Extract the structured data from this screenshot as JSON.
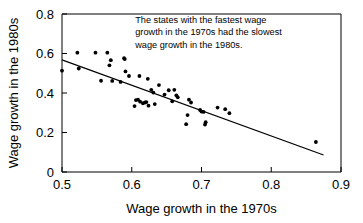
{
  "chart_data": {
    "type": "scatter",
    "title": "",
    "xlabel": "Wage growth in the 1970s",
    "ylabel": "Wage growth in the 1980s",
    "xlim": [
      0.5,
      0.9
    ],
    "ylim": [
      0,
      0.8
    ],
    "xticks": [
      0.5,
      0.6,
      0.7,
      0.8,
      0.9
    ],
    "xtick_labels": [
      "0.5",
      "0.6",
      "0.7",
      "0.8",
      "0.9"
    ],
    "yticks": [
      0,
      0.2,
      0.4,
      0.6,
      0.8
    ],
    "ytick_labels": [
      "0",
      "0.2",
      "0.4",
      "0.6",
      "0.8"
    ],
    "grid": false,
    "legend": "none",
    "annotation": {
      "lines": [
        "The states with the fastest wage",
        "growth in the 1970s had the slowest",
        "wage growth in the 1980s."
      ],
      "x": 0.605,
      "y": 0.755
    },
    "series": [
      {
        "name": "states",
        "marker": "circle",
        "color": "#000000",
        "points": [
          [
            0.5,
            0.513
          ],
          [
            0.522,
            0.604
          ],
          [
            0.524,
            0.524
          ],
          [
            0.548,
            0.604
          ],
          [
            0.556,
            0.462
          ],
          [
            0.565,
            0.604
          ],
          [
            0.568,
            0.54
          ],
          [
            0.57,
            0.566
          ],
          [
            0.572,
            0.461
          ],
          [
            0.584,
            0.456
          ],
          [
            0.589,
            0.576
          ],
          [
            0.59,
            0.572
          ],
          [
            0.591,
            0.509
          ],
          [
            0.596,
            0.486
          ],
          [
            0.604,
            0.334
          ],
          [
            0.606,
            0.364
          ],
          [
            0.609,
            0.366
          ],
          [
            0.611,
            0.486
          ],
          [
            0.612,
            0.356
          ],
          [
            0.616,
            0.348
          ],
          [
            0.619,
            0.352
          ],
          [
            0.621,
            0.354
          ],
          [
            0.623,
            0.472
          ],
          [
            0.624,
            0.336
          ],
          [
            0.628,
            0.416
          ],
          [
            0.631,
            0.402
          ],
          [
            0.633,
            0.344
          ],
          [
            0.639,
            0.44
          ],
          [
            0.647,
            0.392
          ],
          [
            0.653,
            0.414
          ],
          [
            0.658,
            0.358
          ],
          [
            0.661,
            0.416
          ],
          [
            0.664,
            0.388
          ],
          [
            0.666,
            0.378
          ],
          [
            0.678,
            0.242
          ],
          [
            0.68,
            0.288
          ],
          [
            0.682,
            0.366
          ],
          [
            0.685,
            0.352
          ],
          [
            0.698,
            0.314
          ],
          [
            0.7,
            0.306
          ],
          [
            0.703,
            0.304
          ],
          [
            0.705,
            0.24
          ],
          [
            0.706,
            0.252
          ],
          [
            0.723,
            0.326
          ],
          [
            0.734,
            0.318
          ],
          [
            0.74,
            0.298
          ],
          [
            0.864,
            0.152
          ]
        ]
      }
    ],
    "fit_line": {
      "name": "regression-line",
      "x_start": 0.5,
      "y_start": 0.568,
      "x_end": 0.875,
      "y_end": 0.086,
      "color": "#000000"
    }
  }
}
